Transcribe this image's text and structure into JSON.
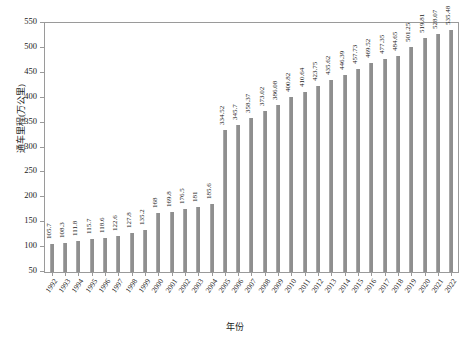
{
  "chart_data": {
    "type": "bar",
    "title": "",
    "xlabel": "年份",
    "ylabel": "通车里程(万公里)",
    "ylim": [
      50,
      550
    ],
    "yticks": [
      50,
      100,
      150,
      200,
      250,
      300,
      350,
      400,
      450,
      500,
      550
    ],
    "grid": false,
    "legend": null,
    "bar_color": "#8f8f8f",
    "categories": [
      "1992",
      "1993",
      "1994",
      "1995",
      "1996",
      "1997",
      "1998",
      "1999",
      "2000",
      "2001",
      "2002",
      "2003",
      "2004",
      "2005",
      "2006",
      "2007",
      "2008",
      "2009",
      "2010",
      "2011",
      "2012",
      "2013",
      "2014",
      "2015",
      "2016",
      "2017",
      "2018",
      "2019",
      "2020",
      "2021",
      "2022"
    ],
    "values": [
      105.7,
      108.3,
      111.8,
      115.7,
      118.6,
      122.6,
      127.8,
      135.2,
      168,
      169.8,
      176.5,
      181,
      185.6,
      334.52,
      345.7,
      358.37,
      373.02,
      386.08,
      400.82,
      410.64,
      423.75,
      435.62,
      446.39,
      457.73,
      469.52,
      477.35,
      484.65,
      501.25,
      519.81,
      528.07,
      535.48
    ],
    "value_labels": [
      "105.7",
      "108.3",
      "111.8",
      "115.7",
      "118.6",
      "122.6",
      "127.8",
      "135.2",
      "168",
      "169.8",
      "176.5",
      "181",
      "185.6",
      "334.52",
      "345.7",
      "358.37",
      "373.02",
      "386.08",
      "400.82",
      "410.64",
      "423.75",
      "435.62",
      "446.39",
      "457.73",
      "469.52",
      "477.35",
      "484.65",
      "501.25",
      "519.81",
      "528.07",
      "535.48"
    ]
  }
}
